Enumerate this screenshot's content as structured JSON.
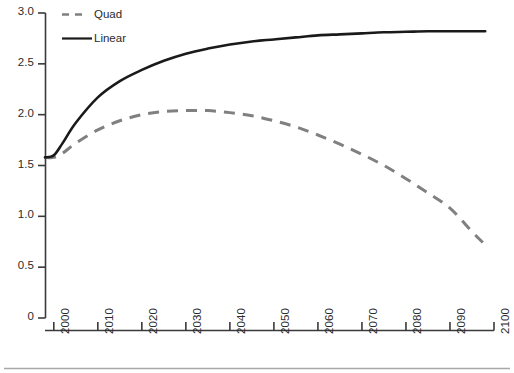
{
  "chart_data": {
    "type": "line",
    "title": "",
    "subtitle": "",
    "xlabel": "",
    "ylabel": "",
    "xlim": [
      1998,
      2100
    ],
    "ylim": [
      0,
      3.0
    ],
    "grid": false,
    "legend_position": "top-left",
    "x_ticks": [
      "2000",
      "2010",
      "2020",
      "2030",
      "2040",
      "2050",
      "2060",
      "2070",
      "2080",
      "2090",
      "2100"
    ],
    "x_tick_values": [
      2000,
      2010,
      2020,
      2030,
      2040,
      2050,
      2060,
      2070,
      2080,
      2090,
      2100
    ],
    "y_ticks": [
      "0",
      "0.5",
      "1.0",
      "1.5",
      "2.0",
      "2.5",
      "3.0"
    ],
    "y_tick_values": [
      0,
      0.5,
      1.0,
      1.5,
      2.0,
      2.5,
      3.0
    ],
    "x": [
      1998,
      2000,
      2002,
      2005,
      2010,
      2015,
      2020,
      2025,
      2030,
      2035,
      2040,
      2045,
      2050,
      2055,
      2060,
      2065,
      2070,
      2075,
      2080,
      2085,
      2090,
      2095,
      2098
    ],
    "series": [
      {
        "name": "Quad",
        "style": "dashed",
        "color": "#808080",
        "values": [
          1.58,
          1.58,
          1.62,
          1.72,
          1.85,
          1.94,
          2.0,
          2.03,
          2.04,
          2.04,
          2.02,
          1.99,
          1.94,
          1.88,
          1.8,
          1.71,
          1.61,
          1.5,
          1.37,
          1.23,
          1.08,
          0.85,
          0.72
        ]
      },
      {
        "name": "Linear",
        "style": "solid",
        "color": "#1a1a1a",
        "values": [
          1.58,
          1.6,
          1.72,
          1.92,
          2.17,
          2.33,
          2.44,
          2.53,
          2.6,
          2.65,
          2.69,
          2.72,
          2.74,
          2.76,
          2.78,
          2.79,
          2.8,
          2.81,
          2.815,
          2.82,
          2.82,
          2.82,
          2.82
        ]
      }
    ],
    "legend": [
      {
        "label": "Quad",
        "style": "dashed",
        "color": "#808080"
      },
      {
        "label": "Linear",
        "style": "solid",
        "color": "#1a1a1a"
      }
    ],
    "axis_color": "#3a3a3a",
    "footer_rule_color": "#a8a8a8"
  }
}
